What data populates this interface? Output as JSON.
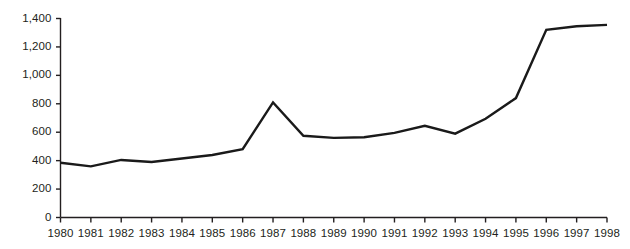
{
  "chart_data": {
    "type": "line",
    "title": "",
    "subtitle": "",
    "xlabel": "",
    "ylabel": "",
    "categories": [
      "1980",
      "1981",
      "1982",
      "1983",
      "1984",
      "1985",
      "1986",
      "1987",
      "1988",
      "1989",
      "1990",
      "1991",
      "1992",
      "1993",
      "1994",
      "1995",
      "1996",
      "1997",
      "1998"
    ],
    "values": [
      385,
      360,
      405,
      390,
      415,
      440,
      480,
      810,
      575,
      560,
      565,
      595,
      645,
      590,
      695,
      840,
      1320,
      1345,
      1355
    ],
    "x": [
      1980,
      1981,
      1982,
      1983,
      1984,
      1985,
      1986,
      1987,
      1988,
      1989,
      1990,
      1991,
      1992,
      1993,
      1994,
      1995,
      1996,
      1997,
      1998
    ],
    "series": [
      {
        "name": "series-1",
        "color": "#1a1a1a",
        "values": [
          385,
          360,
          405,
          390,
          415,
          440,
          480,
          810,
          575,
          560,
          565,
          595,
          645,
          590,
          695,
          840,
          1320,
          1345,
          1355
        ]
      }
    ],
    "ylim": [
      0,
      1400
    ],
    "xlim": [
      1980,
      1998
    ],
    "y_ticks": [
      0,
      200,
      400,
      600,
      800,
      1000,
      1200,
      1400
    ],
    "y_tick_labels": [
      "0",
      "200",
      "400",
      "600",
      "800",
      "1,000",
      "1,200",
      "1,400"
    ],
    "x_ticks": [
      1980,
      1981,
      1982,
      1983,
      1984,
      1985,
      1986,
      1987,
      1988,
      1989,
      1990,
      1991,
      1992,
      1993,
      1994,
      1995,
      1996,
      1997,
      1998
    ],
    "x_tick_labels": [
      "1980",
      "1981",
      "1982",
      "1983",
      "1984",
      "1985",
      "1986",
      "1987",
      "1988",
      "1989",
      "1990",
      "1991",
      "1992",
      "1993",
      "1994",
      "1995",
      "1996",
      "1997",
      "1998"
    ],
    "grid": false,
    "legend": false,
    "legend_position": "none",
    "annotations": [],
    "colors": {
      "line": "#1a1a1a",
      "axis": "#231f20",
      "text": "#231f20",
      "background": "#ffffff"
    }
  },
  "axes": {
    "y_axis_name": "y-axis",
    "x_axis_name": "x-axis"
  }
}
